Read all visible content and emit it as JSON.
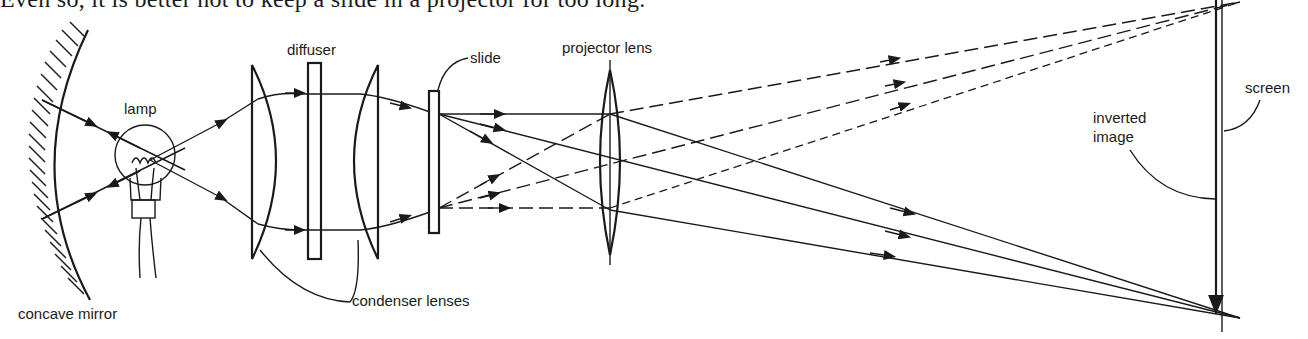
{
  "page": {
    "cut_text": "Even so, it is better not to keep a slide in a projector for too long."
  },
  "diagram": {
    "labels": {
      "lamp": "lamp",
      "diffuser": "diffuser",
      "slide": "slide",
      "projector_lens": "projector lens",
      "screen": "screen",
      "inverted_image_line1": "inverted",
      "inverted_image_line2": "image",
      "concave_mirror": "concave mirror",
      "condenser_lenses": "condenser lenses"
    },
    "colors": {
      "ink": "#1a1a1a",
      "background": "#ffffff"
    }
  }
}
